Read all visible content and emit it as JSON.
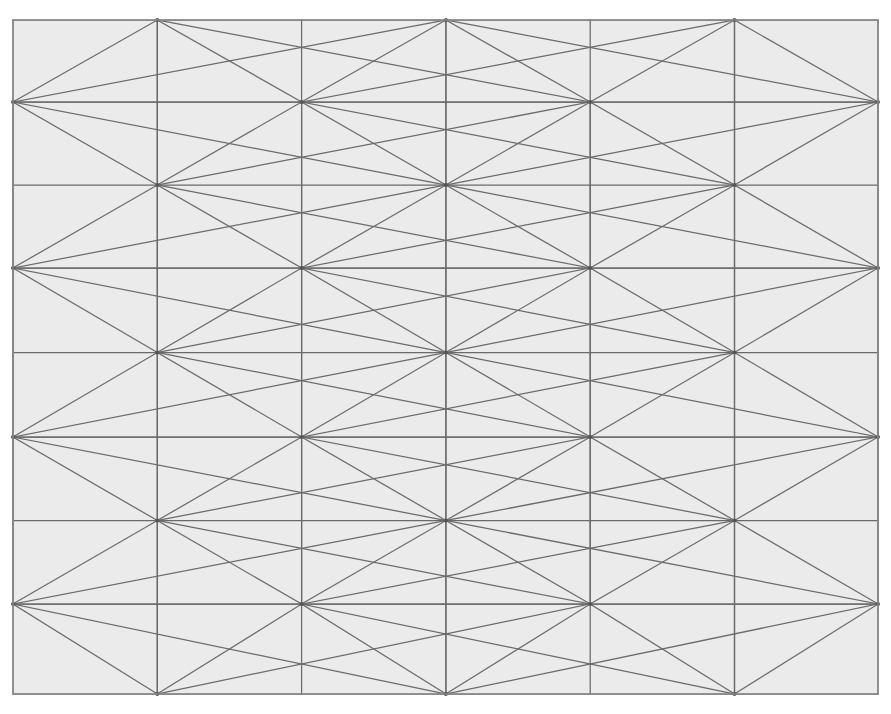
{
  "figure": {
    "type": "geometric-pattern",
    "name": "triangulated-mesh",
    "width": 891,
    "height": 714
  },
  "colors": {
    "page_background": "#ffffff",
    "panel_fill": "#ebebeb",
    "line_stroke": "#6a6a6a",
    "border_stroke": "#8a8a8a",
    "node_fill": "#555555"
  },
  "strokes": {
    "line_width": 1.25,
    "border_width": 1.5,
    "node_radius": 2.0
  },
  "panel": {
    "x0": 13,
    "y0": 20,
    "x1": 878,
    "y1": 694
  },
  "grid": {
    "columns": [
      13,
      157.3,
      301.6,
      445.9,
      590.2,
      734.5,
      878
    ],
    "rows_major": [
      102,
      268,
      437,
      604
    ],
    "rows_mid": [
      20,
      185,
      352.5,
      520.5,
      694
    ],
    "column_spacing": 144.17,
    "row_spacing": 167.3,
    "major_hub_columns": [
      13,
      301.6,
      590.2,
      878
    ],
    "mid_hub_columns": [
      157.3,
      445.9,
      734.5
    ]
  },
  "chart_data": {
    "type": "diagram",
    "title": "",
    "xlabel": "",
    "ylabel": "",
    "node_counts": {
      "major_hubs": 16,
      "mid_hubs": 15,
      "total_vertices": 31
    },
    "structure": "Each rectangular cell bounded by two major-hub columns and two major rows is subdivided by a central mid-hub vertex; diagonals connect the central vertex to all four corners plus mid-edge points, producing triangular faces."
  }
}
